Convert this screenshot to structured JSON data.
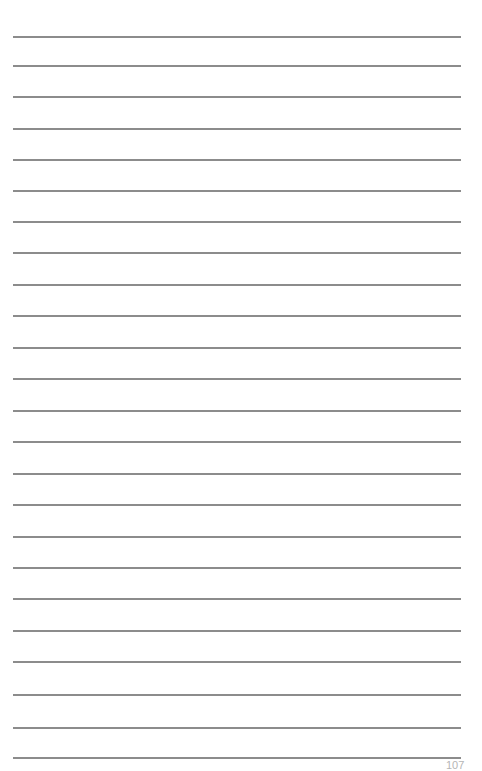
{
  "page": {
    "type": "lined-notebook-page",
    "background_color": "#ffffff",
    "rule_color": "#8c8c8c",
    "rule_left": 13,
    "rule_right": 461,
    "rule_thickness": 2,
    "rules_y": [
      36,
      65,
      96,
      128,
      159,
      190,
      221,
      252,
      284,
      315,
      347,
      378,
      410,
      441,
      473,
      504,
      536,
      567,
      598,
      630,
      661,
      694,
      727,
      757
    ]
  },
  "footer": {
    "page_number": "107"
  }
}
